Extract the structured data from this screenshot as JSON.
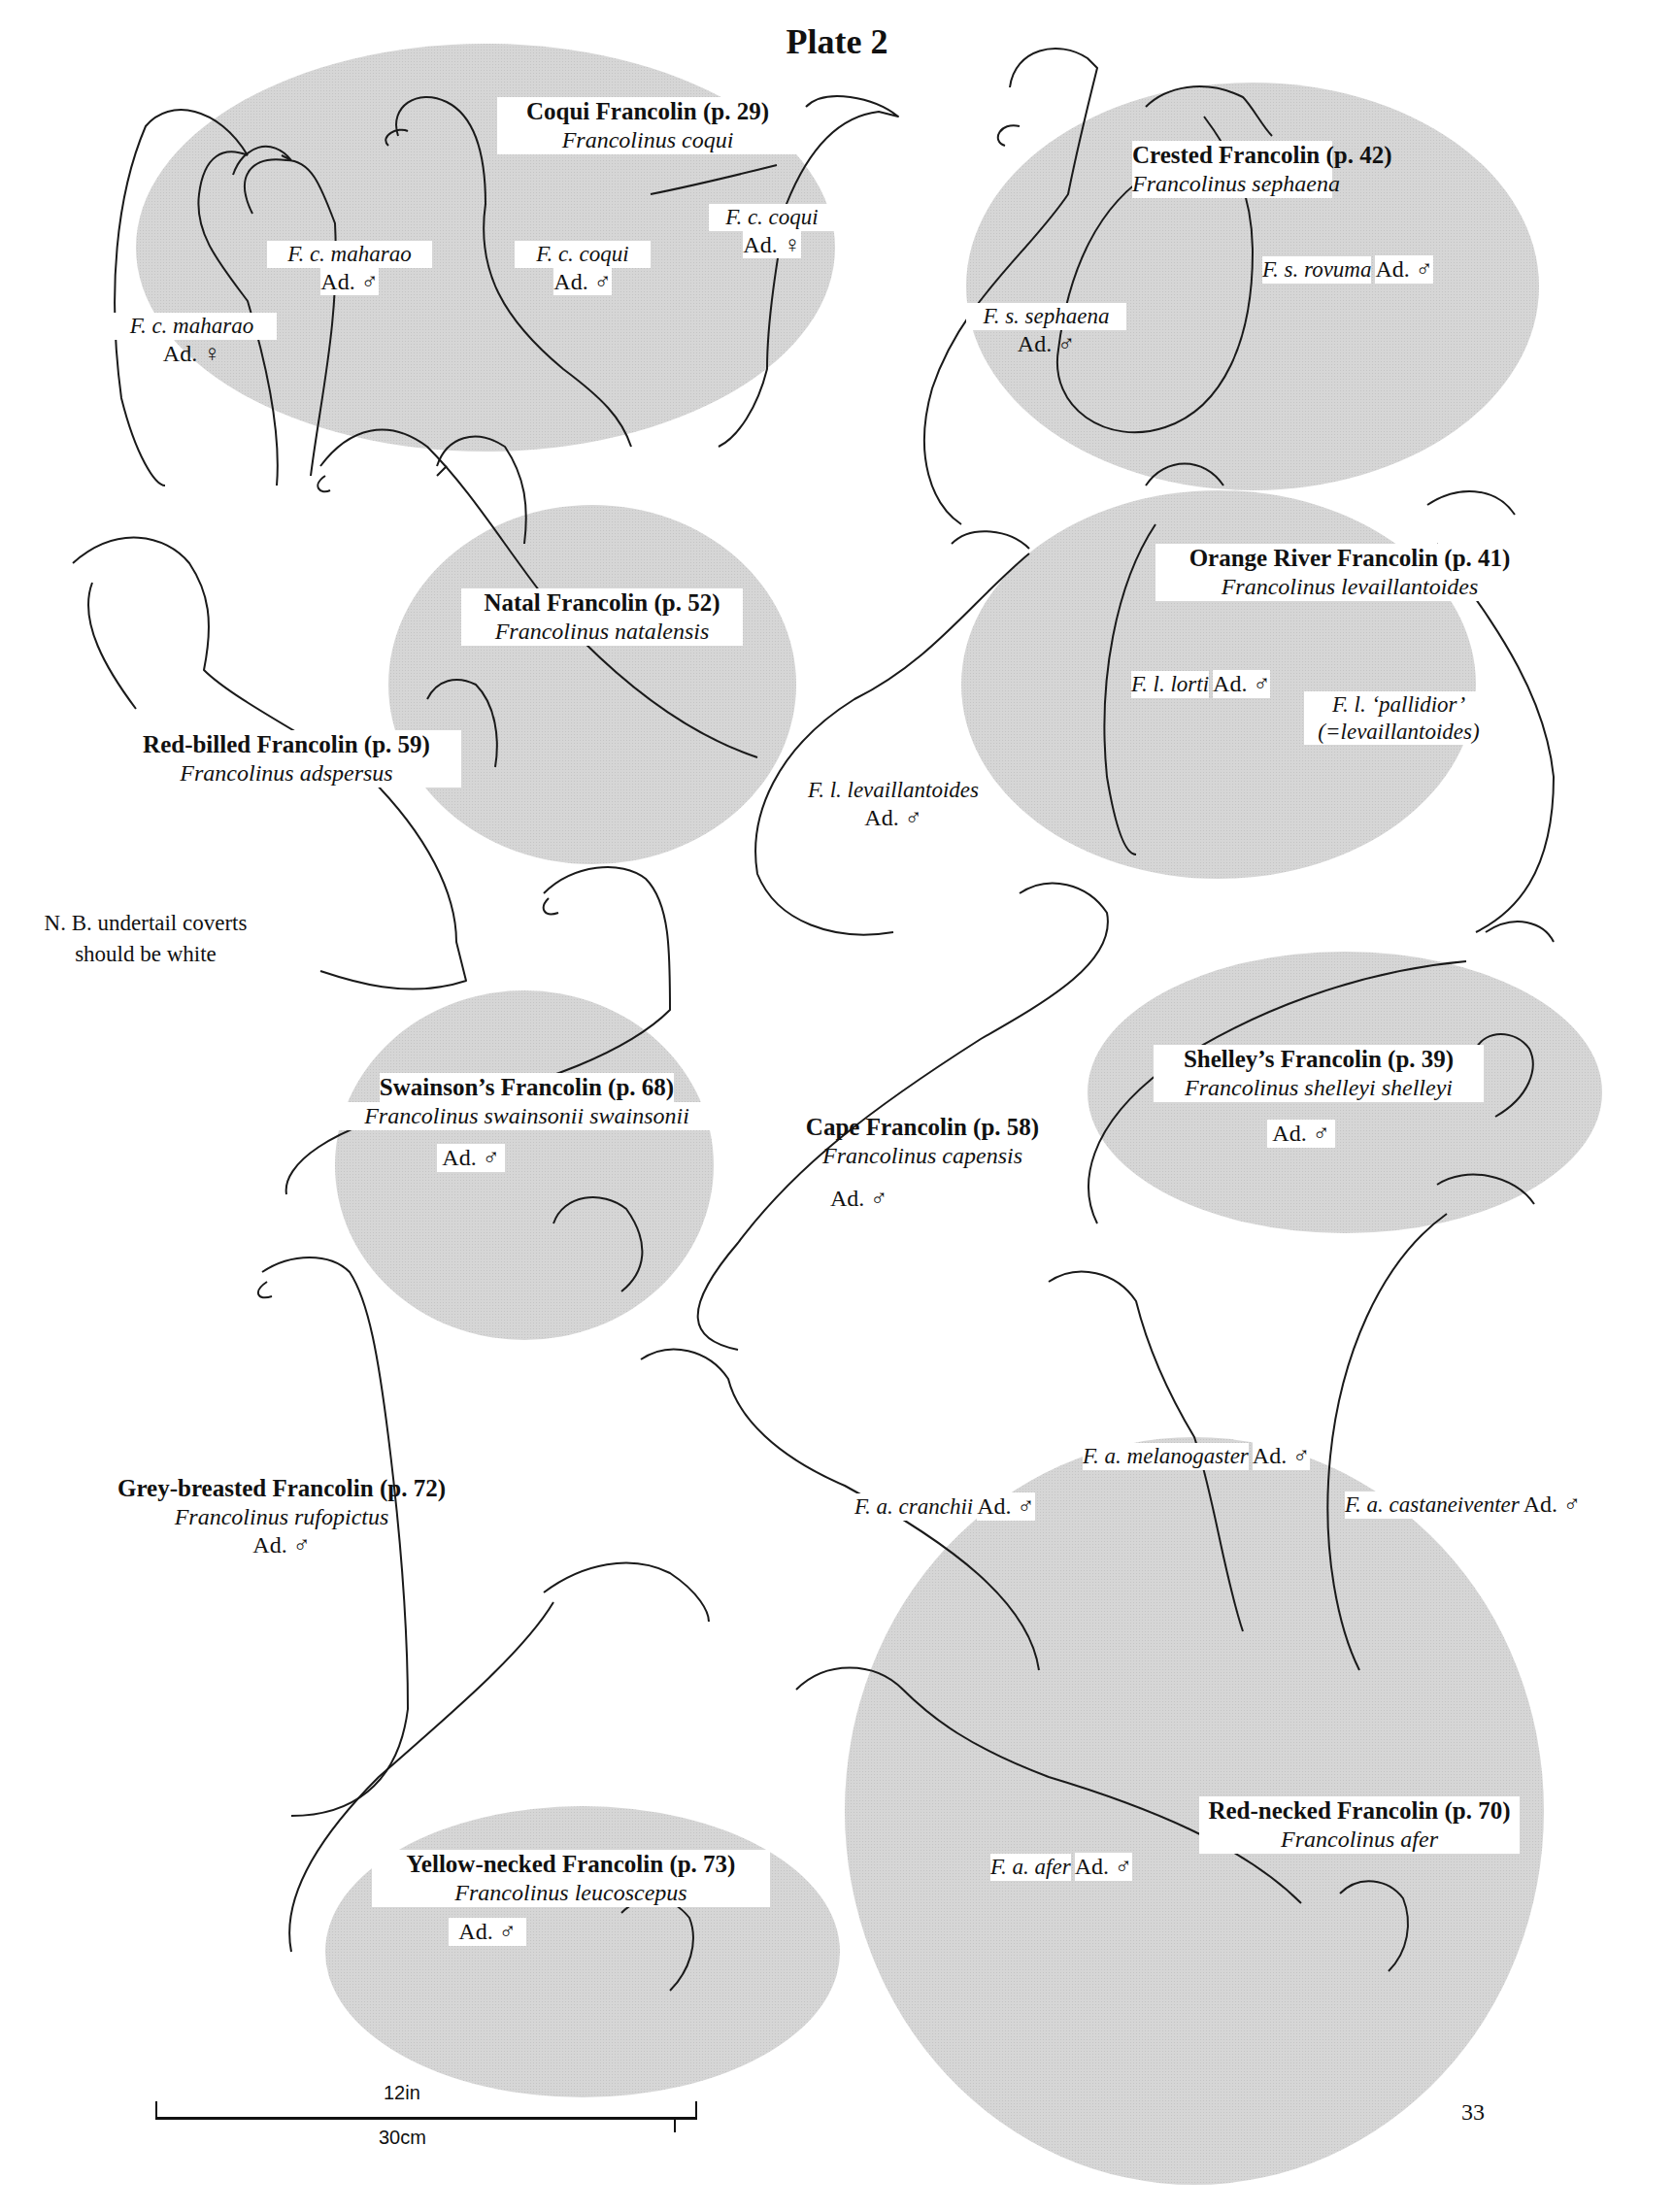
{
  "plate": {
    "title": "Plate 2",
    "page_number": "33"
  },
  "note": {
    "line1": "N. B. undertail coverts",
    "line2": "should be white"
  },
  "scale_bar": {
    "imperial": "12in",
    "metric": "30cm"
  },
  "colors": {
    "oval_fill": "#d4d4d4",
    "outline": "#1a1a1a",
    "label_bg": "#ffffff"
  },
  "species": [
    {
      "common": "Coqui Francolin (p. 29)",
      "scientific": "Francolinus coqui",
      "forms": [
        {
          "name": "F. c. maharao",
          "age": "Ad. ♀"
        },
        {
          "name": "F. c. maharao",
          "age": "Ad. ♂"
        },
        {
          "name": "F. c. coqui",
          "age": "Ad. ♂"
        },
        {
          "name": "F. c. coqui",
          "age": "Ad. ♀"
        }
      ]
    },
    {
      "common": "Crested Francolin (p. 42)",
      "scientific": "Francolinus sephaena",
      "forms": [
        {
          "name": "F. s. sephaena",
          "age": "Ad. ♂"
        },
        {
          "name": "F. s. rovuma",
          "age": "Ad. ♂"
        }
      ]
    },
    {
      "common": "Natal Francolin (p. 52)",
      "scientific": "Francolinus natalensis",
      "forms": []
    },
    {
      "common": "Red-billed Francolin (p. 59)",
      "scientific": "Francolinus adspersus",
      "forms": []
    },
    {
      "common": "Orange River Francolin (p. 41)",
      "scientific": "Francolinus levaillantoides",
      "forms": [
        {
          "name": "F. l. lorti",
          "age": "Ad. ♂"
        },
        {
          "name": "F. l. ‘pallidior’",
          "age": "(=levaillantoides)"
        },
        {
          "name": "F. l. levaillantoides",
          "age": "Ad. ♂"
        }
      ]
    },
    {
      "common": "Shelley’s Francolin (p. 39)",
      "scientific": "Francolinus shelleyi shelleyi",
      "age": "Ad. ♂",
      "forms": []
    },
    {
      "common": "Swainson’s Francolin (p. 68)",
      "scientific": "Francolinus swainsonii swainsonii",
      "age": "Ad. ♂",
      "forms": []
    },
    {
      "common": "Cape Francolin (p. 58)",
      "scientific": "Francolinus capensis",
      "age": "Ad. ♂",
      "forms": []
    },
    {
      "common": "Grey-breasted Francolin (p. 72)",
      "scientific": "Francolinus rufopictus",
      "age": "Ad. ♂",
      "forms": []
    },
    {
      "common": "Yellow-necked Francolin (p. 73)",
      "scientific": "Francolinus leucoscepus",
      "age": "Ad. ♂",
      "forms": []
    },
    {
      "common": "Red-necked Francolin (p. 70)",
      "scientific": "Francolinus afer",
      "forms": [
        {
          "name": "F. a. cranchii",
          "age": "Ad. ♂"
        },
        {
          "name": "F. a. melanogaster",
          "age": "Ad. ♂"
        },
        {
          "name": "F. a. castaneiventer",
          "age": "Ad. ♂"
        },
        {
          "name": "F. a. afer",
          "age": "Ad. ♂"
        }
      ]
    }
  ]
}
